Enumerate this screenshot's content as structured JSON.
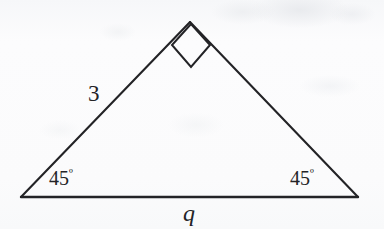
{
  "figure": {
    "kind": "geometry-diagram",
    "shape": "isosceles-right-triangle",
    "canvas": {
      "width": 384,
      "height": 229
    },
    "background_color": "#fbfbfc",
    "stroke_color": "#232326",
    "text_color": "#232326",
    "vertices": {
      "apex": {
        "x": 190,
        "y": 22
      },
      "bottom_left": {
        "x": 21,
        "y": 197
      },
      "bottom_right": {
        "x": 358,
        "y": 197
      }
    },
    "right_angle_marker": {
      "at_vertex": "apex",
      "points": "191,24 172,45 191,67 210,45"
    },
    "labels": {
      "left_side_length": "3",
      "angle_left_value": "45",
      "angle_left_unit": "º",
      "angle_right_value": "45",
      "angle_right_unit": "º",
      "base_label": "q"
    }
  }
}
